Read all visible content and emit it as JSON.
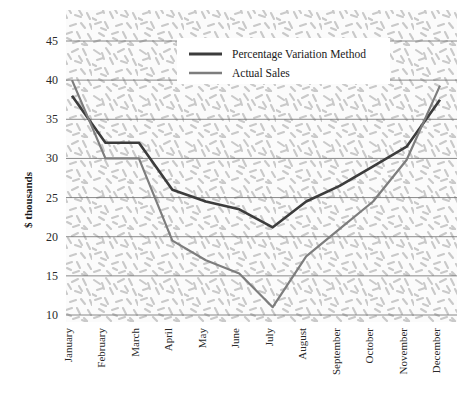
{
  "chart_data": {
    "type": "line",
    "title": "",
    "xlabel": "",
    "ylabel": "$ thousands",
    "categories": [
      "January",
      "February",
      "March",
      "April",
      "May",
      "June",
      "July",
      "August",
      "September",
      "October",
      "November",
      "December"
    ],
    "ylim": [
      10,
      45
    ],
    "yticks": [
      10,
      15,
      20,
      25,
      30,
      35,
      40,
      45
    ],
    "ytick_labels": [
      "10",
      "15",
      "20",
      "25",
      "30",
      "35",
      "40",
      "45"
    ],
    "grid": true,
    "grid_axis": "y",
    "legend_position": "top-center",
    "plot_background": "hatched-texture",
    "series": [
      {
        "name": "Percentage Variation Method",
        "color": "#3c3c3c",
        "line_width": 2.6,
        "values": [
          38.0,
          32.0,
          32.0,
          26.0,
          24.5,
          23.5,
          21.2,
          24.5,
          26.5,
          29.0,
          31.5,
          37.5
        ]
      },
      {
        "name": "Actual Sales",
        "color": "#7d7d7d",
        "line_width": 2.2,
        "values": [
          40.0,
          30.0,
          30.0,
          19.5,
          17.0,
          15.3,
          11.0,
          17.5,
          21.0,
          24.5,
          29.8,
          39.3
        ]
      }
    ]
  },
  "axis": {
    "y_title": "$ thousands"
  },
  "legend": {
    "entries": [
      {
        "label": "Percentage Variation Method"
      },
      {
        "label": "Actual Sales"
      }
    ]
  },
  "colors": {
    "series_dark": "#3c3c3c",
    "series_light": "#7d7d7d",
    "gridline": "#6d6d6d",
    "text": "#1a1a1a",
    "plot_fill": "#fbfbfb",
    "texture": "#c9c9c9",
    "legend_bg": "#ffffff"
  }
}
